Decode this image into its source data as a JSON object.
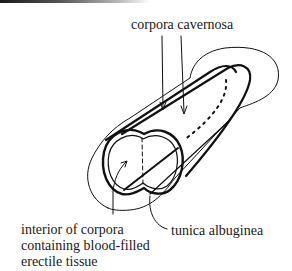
{
  "diagram": {
    "labels": {
      "top": "corpora cavernosa",
      "bottom_left": [
        "interior of corpora",
        "containing blood-filled",
        "erectile tissue"
      ],
      "bottom_right": "tunica albuginea"
    },
    "colors": {
      "line": "#111111",
      "background": "#ffffff"
    }
  }
}
